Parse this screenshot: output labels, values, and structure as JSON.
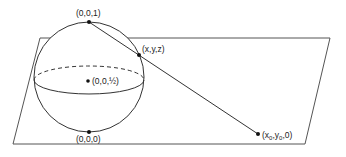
{
  "diagram": {
    "labels": {
      "north_pole": "(0,0,1)",
      "sphere_point": "(x,y,z)",
      "center": "(0,0,½)",
      "south_pole": "(0,0,0)",
      "plane_point_prefix": "(x",
      "plane_point_sub0": "0",
      "plane_point_mid": ",y",
      "plane_point_sub1": "0",
      "plane_point_suffix": ",0)"
    },
    "colors": {
      "stroke": "#333333",
      "background": "#ffffff"
    }
  }
}
